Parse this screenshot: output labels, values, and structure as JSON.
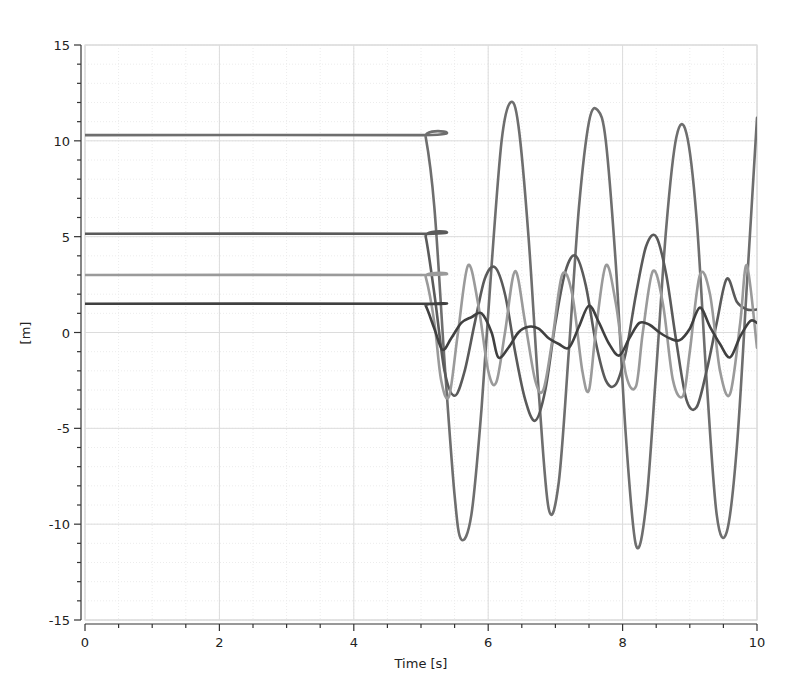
{
  "chart_data": {
    "type": "line",
    "title": "",
    "xlabel": "Time [s]",
    "ylabel": "[m]",
    "xlim": [
      0,
      10
    ],
    "ylim": [
      -15,
      15
    ],
    "x_ticks": [
      0,
      2,
      4,
      6,
      8,
      10
    ],
    "x_tick_labels": [
      "0",
      "2",
      "4",
      "6",
      "8",
      "10"
    ],
    "y_ticks": [
      -15,
      -10,
      -5,
      0,
      5,
      10,
      15
    ],
    "y_tick_labels": [
      "-15",
      "-10",
      "-5",
      "0",
      "5",
      "10",
      "15"
    ],
    "grid": true,
    "legend": "none",
    "series": [
      {
        "name": "series_1",
        "color": "#6e6e6e",
        "x": [
          0,
          5.0,
          5.07,
          5.2,
          5.35,
          5.5,
          5.6,
          5.75,
          5.9,
          6.05,
          6.2,
          6.33,
          6.45,
          6.6,
          6.75,
          6.9,
          7.05,
          7.2,
          7.35,
          7.5,
          7.63,
          7.75,
          7.9,
          8.05,
          8.2,
          8.35,
          8.5,
          8.65,
          8.8,
          8.95,
          9.1,
          9.25,
          9.4,
          9.55,
          9.7,
          9.85,
          10.0
        ],
        "y": [
          10.3,
          10.3,
          10.2,
          6.5,
          -1.5,
          -8.5,
          -10.8,
          -9.5,
          -4.0,
          3.5,
          10.0,
          12.0,
          10.8,
          5.0,
          -3.0,
          -9.2,
          -7.8,
          -1.0,
          6.5,
          11.0,
          11.6,
          10.0,
          3.5,
          -5.5,
          -11.1,
          -9.0,
          -2.0,
          5.5,
          10.2,
          10.4,
          6.0,
          -2.5,
          -9.5,
          -10.4,
          -6.0,
          2.5,
          11.2
        ]
      },
      {
        "name": "series_2",
        "color": "#5a5a5a",
        "x": [
          0,
          5.0,
          5.07,
          5.2,
          5.35,
          5.5,
          5.65,
          5.8,
          5.95,
          6.1,
          6.25,
          6.4,
          6.55,
          6.7,
          6.85,
          7.0,
          7.15,
          7.3,
          7.45,
          7.6,
          7.75,
          7.9,
          8.05,
          8.2,
          8.35,
          8.5,
          8.65,
          8.8,
          8.95,
          9.1,
          9.25,
          9.4,
          9.55,
          9.7,
          9.85,
          10.0
        ],
        "y": [
          5.15,
          5.15,
          5.0,
          2.0,
          -2.0,
          -3.3,
          -2.0,
          0.5,
          2.8,
          3.4,
          2.0,
          -1.0,
          -3.5,
          -4.6,
          -3.0,
          0.5,
          3.2,
          4.0,
          2.5,
          -0.5,
          -2.5,
          -2.7,
          -1.0,
          2.0,
          4.5,
          5.0,
          3.0,
          -0.5,
          -3.5,
          -3.9,
          -2.0,
          0.5,
          2.8,
          1.6,
          1.2,
          1.2
        ]
      },
      {
        "name": "series_3",
        "color": "#9a9a9a",
        "x": [
          0,
          5.0,
          5.07,
          5.2,
          5.3,
          5.42,
          5.55,
          5.7,
          5.85,
          6.0,
          6.12,
          6.25,
          6.4,
          6.55,
          6.7,
          6.82,
          6.95,
          7.1,
          7.25,
          7.4,
          7.5,
          7.6,
          7.75,
          7.9,
          8.05,
          8.2,
          8.3,
          8.45,
          8.6,
          8.75,
          8.9,
          9.0,
          9.15,
          9.3,
          9.45,
          9.6,
          9.75,
          9.85,
          10.0
        ],
        "y": [
          3.0,
          3.0,
          2.9,
          0.5,
          -2.5,
          -3.3,
          0.0,
          3.5,
          1.5,
          -2.0,
          -2.6,
          0.0,
          3.2,
          0.5,
          -2.5,
          -3.0,
          -0.5,
          3.0,
          2.0,
          -2.0,
          -3.0,
          0.0,
          3.5,
          1.5,
          -2.2,
          -2.8,
          0.0,
          3.2,
          1.5,
          -2.5,
          -3.3,
          -1.0,
          3.0,
          2.0,
          -2.0,
          -3.2,
          0.5,
          3.5,
          -0.8
        ]
      },
      {
        "name": "series_4",
        "color": "#404040",
        "x": [
          0,
          5.0,
          5.07,
          5.2,
          5.32,
          5.45,
          5.6,
          5.75,
          5.9,
          6.05,
          6.15,
          6.3,
          6.45,
          6.6,
          6.75,
          6.9,
          7.05,
          7.2,
          7.35,
          7.5,
          7.65,
          7.8,
          7.95,
          8.1,
          8.25,
          8.4,
          8.55,
          8.7,
          8.85,
          9.0,
          9.15,
          9.3,
          9.45,
          9.6,
          9.75,
          9.9,
          10.0
        ],
        "y": [
          1.5,
          1.5,
          1.4,
          0.2,
          -0.9,
          -0.3,
          0.5,
          0.8,
          1.0,
          0.0,
          -1.3,
          -0.8,
          0.0,
          0.3,
          0.2,
          -0.3,
          -0.6,
          -0.8,
          0.3,
          1.4,
          0.5,
          -0.6,
          -1.2,
          -0.3,
          0.5,
          0.4,
          0.0,
          -0.3,
          -0.4,
          0.2,
          1.3,
          0.3,
          -0.6,
          -1.3,
          -0.2,
          0.6,
          0.5
        ]
      }
    ]
  }
}
